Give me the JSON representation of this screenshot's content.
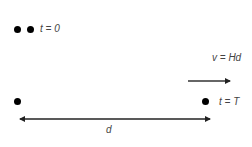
{
  "diagram": {
    "top_row": {
      "label": "t = 0",
      "dots": 2
    },
    "bottom_row": {
      "right_label": "t = T",
      "dots": 2
    },
    "velocity": {
      "label": "v = Hd",
      "direction": "right"
    },
    "distance": {
      "label": "d",
      "direction": "double-headed"
    },
    "colors": {
      "dot": "#000000",
      "arrow": "#222222",
      "text": "#444444"
    }
  }
}
